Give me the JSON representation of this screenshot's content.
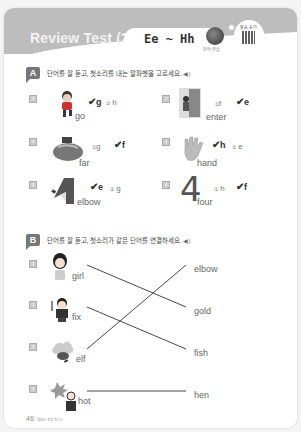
{
  "header": {
    "title": "Review Test (2)",
    "range": "Ee ~ Hh",
    "globe_caption": "단어 연습",
    "qr_label": "발음 듣기"
  },
  "section_a": {
    "badge": "A",
    "instruction": "단어를 잘 듣고, 첫소리를 내는 알파벳을 고르세요.",
    "speaker_icon": "speaker-icon",
    "items": [
      {
        "num": "1",
        "word": "go",
        "options": [
          "g",
          "h"
        ],
        "answer_index": 0,
        "opt_marks": [
          "✔",
          "②"
        ]
      },
      {
        "num": "2",
        "word": "enter",
        "options": [
          "f",
          "e"
        ],
        "answer_index": 1,
        "opt_marks": [
          "①",
          "✔"
        ]
      },
      {
        "num": "3",
        "word": "far",
        "options": [
          "g",
          "f"
        ],
        "answer_index": 1,
        "opt_marks": [
          "①",
          "✔"
        ]
      },
      {
        "num": "4",
        "word": "hand",
        "options": [
          "h",
          "e"
        ],
        "answer_index": 0,
        "opt_marks": [
          "✔",
          "②"
        ]
      },
      {
        "num": "5",
        "word": "elbow",
        "options": [
          "e",
          "g"
        ],
        "answer_index": 0,
        "opt_marks": [
          "✔",
          "②"
        ]
      },
      {
        "num": "6",
        "word": "four",
        "options": [
          "h",
          "f"
        ],
        "answer_index": 1,
        "opt_marks": [
          "①",
          "✔"
        ]
      }
    ]
  },
  "section_b": {
    "badge": "B",
    "instruction": "단어를 잘 듣고, 첫소리가 같은 단어를 연결하세요.",
    "left": [
      {
        "num": "1",
        "word": "girl"
      },
      {
        "num": "2",
        "word": "fix"
      },
      {
        "num": "3",
        "word": "elf"
      },
      {
        "num": "4",
        "word": "hot"
      }
    ],
    "right": [
      "elbow",
      "gold",
      "fish",
      "hen"
    ],
    "connections": [
      [
        "girl",
        "gold"
      ],
      [
        "fix",
        "fish"
      ],
      [
        "elf",
        "elbow"
      ],
      [
        "hot",
        "hen"
      ]
    ]
  },
  "footer": {
    "page_number": "46",
    "text": "영원드 초등 파닉스"
  }
}
